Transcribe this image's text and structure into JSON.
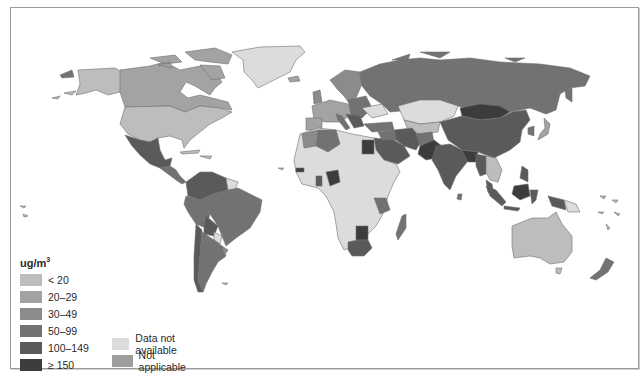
{
  "map": {
    "title": "",
    "subject": "Air pollution concentration by country (ug/m3)",
    "colors": {
      "lt20": "#bdbdbd",
      "c20_29": "#a3a3a3",
      "c30_49": "#8b8b8b",
      "c50_99": "#727272",
      "c100_149": "#5a5a5a",
      "ge150": "#3c3c3c",
      "not_available": "#dcdcdc",
      "not_applicable": "#9d9d9d",
      "border": "#6f6f6f"
    }
  },
  "legend": {
    "unit": "ug/m",
    "unit_sup": "3",
    "items": [
      {
        "label": "< 20",
        "color": "#bdbdbd"
      },
      {
        "label": "20–29",
        "color": "#a3a3a3"
      },
      {
        "label": "30–49",
        "color": "#8b8b8b"
      },
      {
        "label": "50–99",
        "color": "#727272"
      },
      {
        "label": "100–149",
        "color": "#5a5a5a"
      },
      {
        "label": "≥ 150",
        "color": "#3c3c3c"
      }
    ],
    "extra_items": [
      {
        "label": "Data not available",
        "color": "#dcdcdc"
      },
      {
        "label": "Not applicable",
        "color": "#9d9d9d"
      }
    ]
  }
}
